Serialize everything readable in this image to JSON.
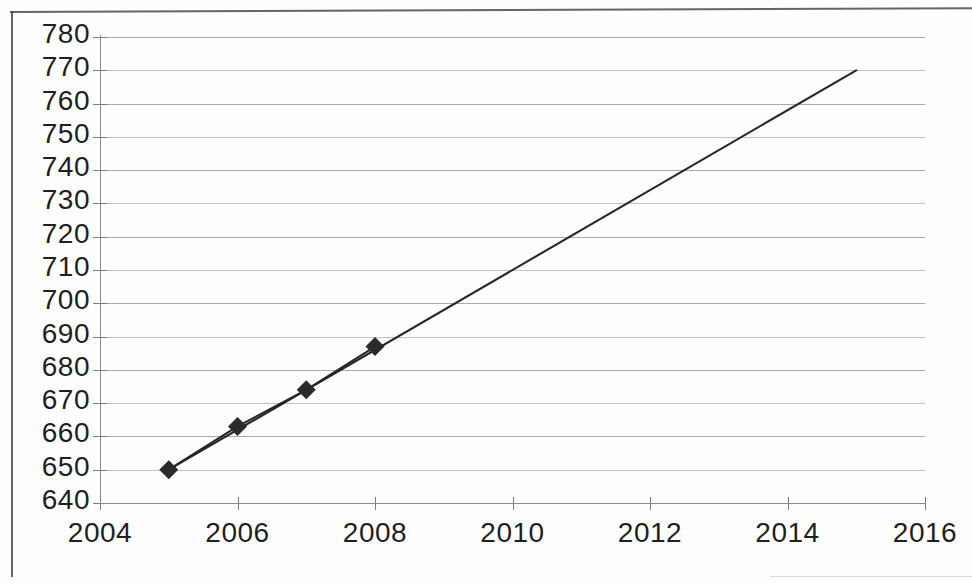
{
  "chart_data": {
    "type": "line",
    "title": "",
    "subtitle": "",
    "xlabel": "",
    "ylabel": "",
    "xlim": [
      2004,
      2016
    ],
    "ylim": [
      640,
      780
    ],
    "grid": true,
    "legend": "none",
    "marker": "diamond",
    "marker_color": "#2b2b2b",
    "line_color": "#262626",
    "x_ticks": [
      2004,
      2006,
      2008,
      2010,
      2012,
      2014,
      2016
    ],
    "x_tick_labels": [
      "2004",
      "2006",
      "2008",
      "2010",
      "2012",
      "2014",
      "2016"
    ],
    "y_ticks": [
      640,
      650,
      660,
      670,
      680,
      690,
      700,
      710,
      720,
      730,
      740,
      750,
      760,
      770,
      780
    ],
    "y_tick_labels": [
      "640",
      "650",
      "660",
      "670",
      "680",
      "690",
      "700",
      "710",
      "720",
      "730",
      "740",
      "750",
      "760",
      "770",
      "780"
    ],
    "series": [
      {
        "name": "observed",
        "marker": "diamond",
        "x": [
          2005,
          2006,
          2007,
          2008
        ],
        "values": [
          650,
          663,
          674,
          687
        ]
      },
      {
        "name": "trendline",
        "marker": "none",
        "x": [
          2005,
          2015
        ],
        "values": [
          650,
          770
        ]
      }
    ],
    "annotations": []
  },
  "figure": {
    "frame_color": "#4a4a4a",
    "gridline_color": "#8e8e8e",
    "axis_color": "#8a8a8a",
    "background": "#ffffff"
  }
}
